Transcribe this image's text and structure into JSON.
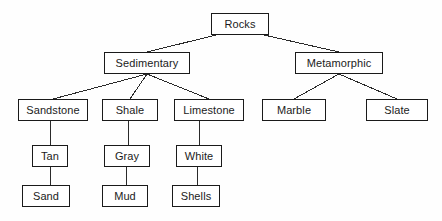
{
  "diagram": {
    "type": "tree",
    "background_color": "#fefefe",
    "box_border_color": "#1a1a1a",
    "box_fill_color": "#ffffff",
    "text_color": "#1b1b1b",
    "edge_color": "#2a2a2a",
    "nodes": [
      {
        "id": "rocks",
        "label": "Rocks",
        "x": 211,
        "y": 13,
        "w": 58,
        "h": 22,
        "level": 0
      },
      {
        "id": "sedimentary",
        "label": "Sedimentary",
        "x": 104,
        "y": 52,
        "w": 86,
        "h": 22,
        "level": 1
      },
      {
        "id": "metamorphic",
        "label": "Metamorphic",
        "x": 295,
        "y": 52,
        "w": 88,
        "h": 22,
        "level": 1
      },
      {
        "id": "sandstone",
        "label": "Sandstone",
        "x": 18,
        "y": 99,
        "w": 70,
        "h": 22,
        "level": 2
      },
      {
        "id": "shale",
        "label": "Shale",
        "x": 102,
        "y": 99,
        "w": 56,
        "h": 22,
        "level": 2
      },
      {
        "id": "limestone",
        "label": "Limestone",
        "x": 174,
        "y": 99,
        "w": 70,
        "h": 22,
        "level": 2
      },
      {
        "id": "marble",
        "label": "Marble",
        "x": 262,
        "y": 99,
        "w": 64,
        "h": 22,
        "level": 2
      },
      {
        "id": "slate",
        "label": "Slate",
        "x": 366,
        "y": 99,
        "w": 62,
        "h": 22,
        "level": 2
      },
      {
        "id": "tan",
        "label": "Tan",
        "x": 32,
        "y": 145,
        "w": 36,
        "h": 22,
        "level": 3
      },
      {
        "id": "gray",
        "label": "Gray",
        "x": 104,
        "y": 145,
        "w": 46,
        "h": 22,
        "level": 3
      },
      {
        "id": "white",
        "label": "White",
        "x": 176,
        "y": 145,
        "w": 46,
        "h": 22,
        "level": 3
      },
      {
        "id": "sand",
        "label": "Sand",
        "x": 22,
        "y": 185,
        "w": 48,
        "h": 22,
        "level": 4
      },
      {
        "id": "mud",
        "label": "Mud",
        "x": 102,
        "y": 185,
        "w": 46,
        "h": 22,
        "level": 4
      },
      {
        "id": "shells",
        "label": "Shells",
        "x": 172,
        "y": 185,
        "w": 48,
        "h": 22,
        "level": 4
      }
    ],
    "edges": [
      {
        "from": "rocks",
        "to": "sedimentary",
        "x1": 216,
        "y1": 35,
        "x2": 147,
        "y2": 52
      },
      {
        "from": "rocks",
        "to": "metamorphic",
        "x1": 264,
        "y1": 35,
        "x2": 339,
        "y2": 52
      },
      {
        "from": "sedimentary",
        "to": "sandstone",
        "x1": 147,
        "y1": 74,
        "x2": 53,
        "y2": 99
      },
      {
        "from": "sedimentary",
        "to": "shale",
        "x1": 147,
        "y1": 74,
        "x2": 130,
        "y2": 99
      },
      {
        "from": "sedimentary",
        "to": "limestone",
        "x1": 147,
        "y1": 74,
        "x2": 209,
        "y2": 99
      },
      {
        "from": "metamorphic",
        "to": "marble",
        "x1": 339,
        "y1": 74,
        "x2": 294,
        "y2": 99
      },
      {
        "from": "metamorphic",
        "to": "slate",
        "x1": 339,
        "y1": 74,
        "x2": 397,
        "y2": 99
      },
      {
        "from": "sandstone",
        "to": "tan",
        "x1": 50,
        "y1": 121,
        "x2": 50,
        "y2": 145
      },
      {
        "from": "shale",
        "to": "gray",
        "x1": 128,
        "y1": 121,
        "x2": 128,
        "y2": 145
      },
      {
        "from": "limestone",
        "to": "white",
        "x1": 199,
        "y1": 121,
        "x2": 199,
        "y2": 145
      },
      {
        "from": "tan",
        "to": "sand",
        "x1": 50,
        "y1": 167,
        "x2": 50,
        "y2": 185
      },
      {
        "from": "gray",
        "to": "mud",
        "x1": 126,
        "y1": 167,
        "x2": 126,
        "y2": 185
      },
      {
        "from": "white",
        "to": "shells",
        "x1": 197,
        "y1": 167,
        "x2": 197,
        "y2": 185
      }
    ]
  }
}
